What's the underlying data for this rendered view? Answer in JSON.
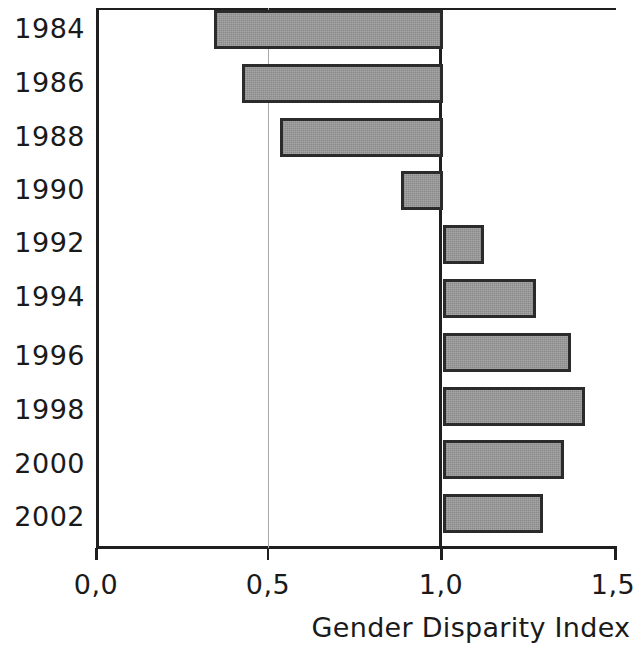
{
  "chart_data": {
    "type": "bar",
    "orientation": "horizontal",
    "title": "",
    "xlabel": "Gender Disparity Index",
    "ylabel": "",
    "categories": [
      "1984",
      "1986",
      "1988",
      "1990",
      "1992",
      "1994",
      "1996",
      "1998",
      "2000",
      "2002"
    ],
    "values": [
      0.34,
      0.42,
      0.53,
      0.88,
      1.12,
      1.27,
      1.37,
      1.41,
      1.35,
      1.29
    ],
    "baseline": 1.0,
    "xlim": [
      0.0,
      1.5
    ],
    "xticks": [
      0.0,
      0.5,
      1.0,
      1.5
    ],
    "xticklabels": [
      "0,0",
      "0,5",
      "1,0",
      "1,5"
    ],
    "grid": "vertical gridline at 0,5 only; heavy baseline at 1,0",
    "legend": "none",
    "bar_fill_color": "#999999",
    "bar_border_color": "#2b2b2b",
    "axis_color": "#1f1f1f",
    "gridline_color": "#a8a8a8",
    "background_color": "#ffffff"
  },
  "axis": {
    "x_title": "Gender Disparity Index",
    "tick_labels": [
      "0,0",
      "0,5",
      "1,0",
      "1,5"
    ],
    "year_labels": [
      "1984",
      "1986",
      "1988",
      "1990",
      "1992",
      "1994",
      "1996",
      "1998",
      "2000",
      "2002"
    ]
  }
}
